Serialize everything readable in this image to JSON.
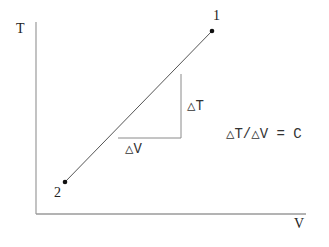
{
  "diagram": {
    "axes": {
      "y_label": "T",
      "x_label": "V"
    },
    "points": [
      {
        "label": "1",
        "x": 212,
        "y": 31
      },
      {
        "label": "2",
        "x": 65,
        "y": 182
      }
    ],
    "slope_triangle": {
      "rise_label": "△T",
      "run_label": "△V"
    },
    "equation": "△T/△V = C",
    "colors": {
      "axis": "#999999",
      "line": "#555555",
      "text": "#333333",
      "point": "#111111"
    }
  }
}
